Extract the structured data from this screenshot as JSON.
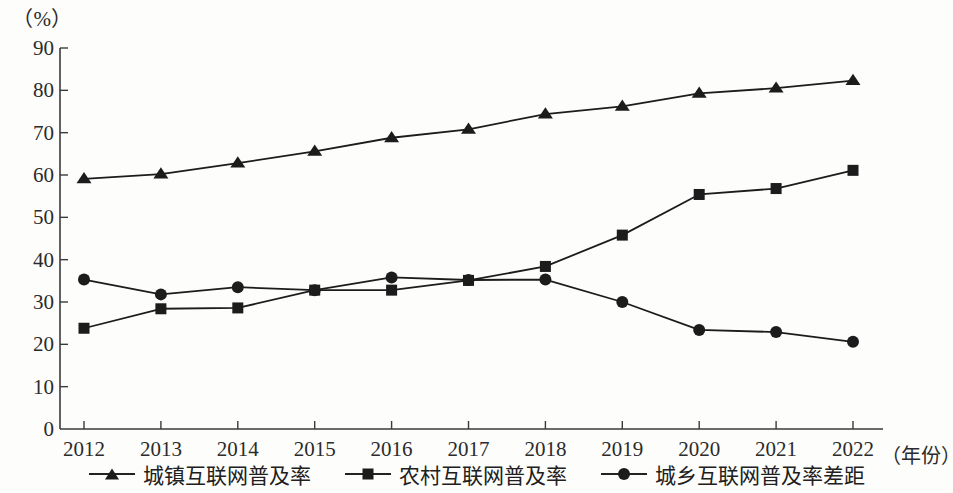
{
  "chart_data": {
    "type": "line",
    "title": "",
    "subtitle": "",
    "unit_label": "（%）",
    "xlabel": "（年份）",
    "ylabel": "%",
    "grid": false,
    "legend_position": "bottom",
    "categories": [
      "2012",
      "2013",
      "2014",
      "2015",
      "2016",
      "2017",
      "2018",
      "2019",
      "2020",
      "2021",
      "2022"
    ],
    "x": [
      2012,
      2013,
      2014,
      2015,
      2016,
      2017,
      2018,
      2019,
      2020,
      2021,
      2022
    ],
    "xlim": [
      2012,
      2022
    ],
    "ylim": [
      0,
      90
    ],
    "y_ticks": [
      0,
      10,
      20,
      30,
      40,
      50,
      60,
      70,
      80,
      90
    ],
    "y_tick_labels": [
      "0",
      "10",
      "20",
      "30",
      "40",
      "50",
      "60",
      "70",
      "80",
      "90"
    ],
    "series": [
      {
        "name": "城镇互联网普及率",
        "marker": "triangle",
        "color": "#1c1c1c",
        "values": [
          59.1,
          60.2,
          62.8,
          65.6,
          68.8,
          70.8,
          74.4,
          76.2,
          79.3,
          80.5,
          82.3
        ]
      },
      {
        "name": "农村互联网普及率",
        "marker": "square",
        "color": "#1c1c1c",
        "values": [
          23.8,
          28.4,
          28.6,
          32.8,
          32.8,
          35.1,
          38.4,
          45.8,
          55.4,
          56.8,
          61.1
        ]
      },
      {
        "name": "城乡互联网普及率差距",
        "marker": "circle",
        "color": "#1c1c1c",
        "values": [
          35.3,
          31.8,
          33.5,
          32.8,
          35.8,
          35.2,
          35.3,
          30.0,
          23.4,
          22.9,
          20.6
        ]
      }
    ]
  },
  "axis": {
    "unit_label": "（%）",
    "x_axis_name": "（年份）"
  },
  "legend": {
    "items": [
      {
        "label": "城镇互联网普及率",
        "marker": "triangle-marker-icon"
      },
      {
        "label": "农村互联网普及率",
        "marker": "square-marker-icon"
      },
      {
        "label": "城乡互联网普及率差距",
        "marker": "circle-marker-icon"
      }
    ]
  }
}
